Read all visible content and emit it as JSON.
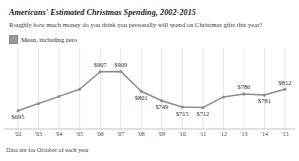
{
  "chart_data": {
    "type": "line",
    "title": "Americans' Estimated Christmas Spending, 2002-2015",
    "subtitle": "Roughly how much money do you think you personally will spend on Christmas gifts this year?",
    "legend": [
      {
        "label": "Mean, including zero",
        "color": "#9a9a9a",
        "marker": "square"
      }
    ],
    "legend_position": "top-left",
    "footnote": "Data are for October of each year",
    "xlabel": "",
    "ylabel": "",
    "grid": "vertical",
    "categories": [
      "'02",
      "'03",
      "'04",
      "'05",
      "'06",
      "'07",
      "'08",
      "'09",
      "'10",
      "'11",
      "'12",
      "'13",
      "'14",
      "'15"
    ],
    "x": [
      2002,
      2003,
      2004,
      2005,
      2006,
      2007,
      2008,
      2009,
      2010,
      2011,
      2012,
      2013,
      2014,
      2015
    ],
    "values": [
      695,
      734,
      773,
      812,
      907,
      909,
      801,
      749,
      715,
      712,
      770,
      786,
      781,
      812
    ],
    "point_labels": [
      "$695",
      "",
      "",
      "",
      "$907",
      "$909",
      "$801",
      "$749",
      "$715",
      "$712",
      "",
      "$786",
      "$781",
      "$812"
    ],
    "label_positions": [
      "below",
      "",
      "",
      "",
      "above",
      "above",
      "below",
      "below",
      "below",
      "below",
      "",
      "above",
      "below",
      "above"
    ],
    "ylim": [
      650,
      960
    ],
    "series_color": "#8c8c8c",
    "grid_color": "#d8d8d8",
    "axis_color": "#b5b5b5"
  },
  "icons": {
    "legend_marker": "square-swatch-icon"
  }
}
